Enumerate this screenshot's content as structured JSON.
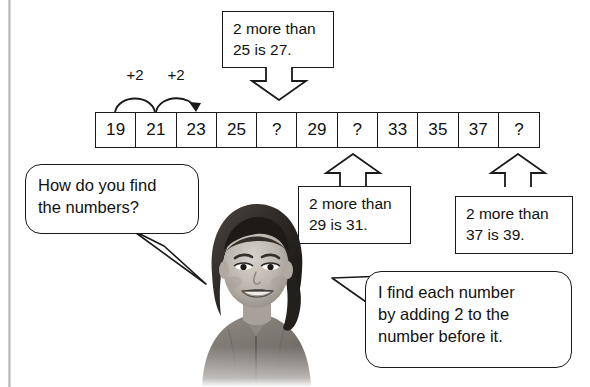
{
  "worksheet": {
    "strip": {
      "name": "number-pattern-strip",
      "cells": [
        "19",
        "21",
        "23",
        "25",
        "?",
        "29",
        "?",
        "33",
        "35",
        "37",
        "?"
      ]
    },
    "step_labels": [
      {
        "text": "+2"
      },
      {
        "text": "+2"
      }
    ],
    "callouts": [
      {
        "id": "callout-25",
        "direction": "down",
        "lines": [
          "2 more than",
          "25 is 27."
        ]
      },
      {
        "id": "callout-29",
        "direction": "up",
        "lines": [
          "2 more than",
          "29 is 31."
        ]
      },
      {
        "id": "callout-37",
        "direction": "up",
        "lines": [
          "2 more than",
          "37 is 39."
        ]
      }
    ],
    "bubbles": [
      {
        "id": "question-bubble",
        "lines": [
          "How do you find",
          "the numbers?"
        ]
      },
      {
        "id": "answer-bubble",
        "lines": [
          "I find each number",
          "by adding 2 to the",
          "number before it."
        ]
      }
    ],
    "photo": {
      "alt": "photo-of-smiling-girl"
    },
    "colors": {
      "ink": "#1a1a1a",
      "background": "#ffffff"
    }
  }
}
